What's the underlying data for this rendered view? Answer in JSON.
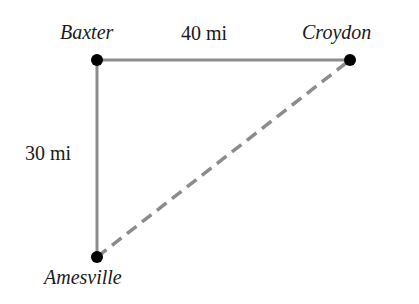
{
  "diagram": {
    "type": "triangle-map",
    "nodes": [
      {
        "id": "baxter",
        "label": "Baxter",
        "x": 97,
        "y": 60
      },
      {
        "id": "croydon",
        "label": "Croydon",
        "x": 350,
        "y": 60
      },
      {
        "id": "amesville",
        "label": "Amesville",
        "x": 97,
        "y": 257
      }
    ],
    "edges": [
      {
        "from": "baxter",
        "to": "croydon",
        "label": "40 mi",
        "style": "solid"
      },
      {
        "from": "baxter",
        "to": "amesville",
        "label": "30 mi",
        "style": "solid"
      },
      {
        "from": "amesville",
        "to": "croydon",
        "label": "",
        "style": "dashed"
      }
    ],
    "colors": {
      "line": "#8c8c8c",
      "dot": "#000000",
      "text": "#1a1a1a"
    }
  }
}
